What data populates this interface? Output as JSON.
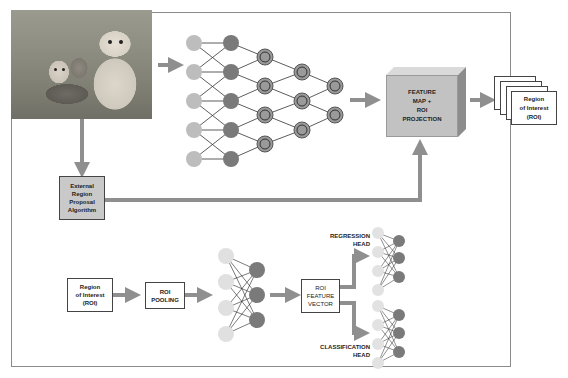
{
  "diagram": {
    "input_image": {
      "description": "puppy and kittens photo"
    },
    "proposal_box": {
      "label": "External Region Proposal Algorithm",
      "lines": [
        "External",
        "Region",
        "Proposal",
        "Algorithm"
      ]
    },
    "feature_box": {
      "label": "FEATURE MAP + ROI PROJECTION",
      "lines": [
        "FEATURE",
        "MAP +",
        "ROI",
        "PROJECTION"
      ]
    },
    "roi_stack": {
      "label": "Region of Interest (ROI)",
      "lines": [
        "Region",
        "of Interest",
        "(ROI)"
      ]
    },
    "roi_input": {
      "label": "Region of Interest (ROI)",
      "lines": [
        "Region",
        "of Interest",
        "(ROI)"
      ]
    },
    "roi_pooling": {
      "label": "ROI POOLING",
      "lines": [
        "ROI",
        "POOLING"
      ]
    },
    "feature_vector": {
      "label": "ROI FEATURE VECTOR",
      "lines": [
        "ROI",
        "FEATURE",
        "VECTOR"
      ]
    },
    "regression_head": {
      "lines": [
        "REGRESSION",
        "HEAD"
      ]
    },
    "classification_head": {
      "lines": [
        "CLASSIFICATION",
        "HEAD"
      ]
    },
    "colors": {
      "frame": "#8a8a8a",
      "arrow": "#8f8f8f",
      "node_light": "#bdbdbd",
      "node_dark": "#7a7a7a",
      "node_pale": "#e2e2e2",
      "box_fill": "#c9c9c9"
    }
  }
}
